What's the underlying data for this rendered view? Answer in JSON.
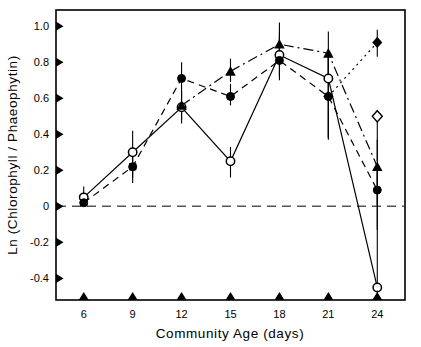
{
  "chart_data": {
    "type": "line",
    "title": "",
    "subtitle": "",
    "xlabel": "Community Age (days)",
    "ylabel": "Ln (Chlorophyll / Phaeophytin)",
    "x": [
      6,
      9,
      12,
      15,
      18,
      21,
      24
    ],
    "xtick_labels": [
      "6",
      "9",
      "12",
      "15",
      "18",
      "21",
      "24"
    ],
    "ytick_labels": [
      "1.0",
      "0.8",
      "0.6",
      "0.4",
      "0.2",
      "0",
      "-0.2",
      "-0.4"
    ],
    "ytick_values": [
      1.0,
      0.8,
      0.6,
      0.4,
      0.2,
      0,
      -0.2,
      -0.4
    ],
    "xlim": [
      4.3,
      25.7
    ],
    "ylim": [
      -0.52,
      1.09
    ],
    "grid": false,
    "legend_position": "none",
    "reference_line": {
      "y": 0,
      "style": "dashed",
      "color": "#555555"
    },
    "series": [
      {
        "name": "open-circle-series",
        "marker": "open-circle",
        "line_style": "solid",
        "color": "#000000",
        "x": [
          6,
          9,
          12,
          15,
          18,
          21,
          24
        ],
        "values": [
          0.05,
          0.3,
          0.55,
          0.25,
          0.84,
          0.71,
          -0.45
        ],
        "err_low": [
          0.05,
          0.14,
          0.09,
          0.09,
          0.12,
          0.33,
          0.07
        ],
        "err_high": [
          0.06,
          0.12,
          0.09,
          0.08,
          0.13,
          0.13,
          0.66
        ]
      },
      {
        "name": "filled-circle-series",
        "marker": "filled-circle",
        "line_style": "dashed",
        "color": "#000000",
        "x": [
          6,
          9,
          12,
          15,
          18,
          21,
          24
        ],
        "values": [
          0.02,
          0.22,
          0.71,
          0.61,
          0.81,
          0.61,
          0.09
        ],
        "err_low": [
          0.02,
          0.09,
          0.08,
          0.05,
          0.11,
          0.23,
          0.22
        ],
        "err_high": [
          0.03,
          0.11,
          0.09,
          0.07,
          0.13,
          0.24,
          0.13
        ]
      },
      {
        "name": "filled-triangle-series",
        "marker": "filled-triangle",
        "line_style": "dash-dot",
        "color": "#000000",
        "x": [
          12,
          15,
          18,
          21,
          24
        ],
        "values": [
          0.56,
          0.75,
          0.9,
          0.85,
          0.22
        ],
        "err_low": [
          0.08,
          0.06,
          0.11,
          0.16,
          0.21
        ],
        "err_high": [
          0.07,
          0.07,
          0.12,
          0.12,
          0.15
        ]
      },
      {
        "name": "diamond-series",
        "marker": "filled-diamond",
        "line_style": "dotted",
        "color": "#000000",
        "x": [
          21,
          24
        ],
        "values": [
          0.61,
          0.91
        ],
        "err_low": [
          0.24,
          0.08
        ],
        "err_high": [
          0.24,
          0.07
        ]
      },
      {
        "name": "open-diamond-point",
        "marker": "open-diamond",
        "line_style": "none",
        "color": "#000000",
        "x": [
          24
        ],
        "values": [
          0.5
        ],
        "err_low": [
          0.25
        ],
        "err_high": [
          0.0
        ]
      }
    ]
  },
  "axes": {
    "y_title": "Ln (Chlorophyll / Phaeophytin)",
    "x_title": "Community Age (days)"
  }
}
